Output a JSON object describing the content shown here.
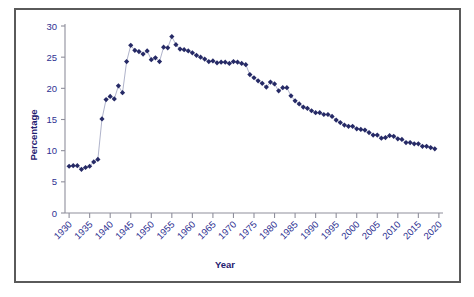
{
  "chart_data": {
    "type": "line",
    "title": "",
    "subtitle": "",
    "xlabel": "Year",
    "ylabel": "Percentage",
    "xlim": [
      1929,
      2021
    ],
    "ylim": [
      0,
      30
    ],
    "xticks": [
      1930,
      1935,
      1940,
      1945,
      1950,
      1955,
      1960,
      1965,
      1970,
      1975,
      1980,
      1985,
      1990,
      1995,
      2000,
      2005,
      2010,
      2015,
      2020
    ],
    "yticks": [
      0,
      5,
      10,
      15,
      20,
      25,
      30
    ],
    "grid": false,
    "legend": "none",
    "marker": "diamond",
    "marker_color": "#262a66",
    "line_color": "#9aa0bd",
    "axis_color": "#8f8f9c",
    "text_color": "#2e3192",
    "frame_color": "#5a5a5a",
    "x": [
      1930,
      1931,
      1932,
      1933,
      1934,
      1935,
      1936,
      1937,
      1938,
      1939,
      1940,
      1941,
      1942,
      1943,
      1944,
      1945,
      1946,
      1947,
      1948,
      1949,
      1950,
      1951,
      1952,
      1953,
      1954,
      1955,
      1956,
      1957,
      1958,
      1959,
      1960,
      1961,
      1962,
      1963,
      1964,
      1965,
      1966,
      1967,
      1968,
      1969,
      1970,
      1971,
      1972,
      1973,
      1974,
      1975,
      1976,
      1977,
      1978,
      1979,
      1980,
      1981,
      1982,
      1983,
      1984,
      1985,
      1986,
      1987,
      1988,
      1989,
      1990,
      1991,
      1992,
      1993,
      1994,
      1995,
      1996,
      1997,
      1998,
      1999,
      2000,
      2001,
      2002,
      2003,
      2004,
      2005,
      2006,
      2007,
      2008,
      2009,
      2010,
      2011,
      2012,
      2013,
      2014,
      2015,
      2016,
      2017,
      2018,
      2019
    ],
    "values": [
      7.5,
      7.6,
      7.6,
      7.0,
      7.3,
      7.5,
      8.2,
      8.6,
      15.1,
      18.2,
      18.7,
      18.3,
      20.4,
      19.3,
      24.3,
      26.9,
      26.1,
      25.9,
      25.5,
      26.0,
      24.6,
      24.9,
      24.3,
      26.6,
      26.5,
      28.3,
      27.0,
      26.3,
      26.2,
      26.0,
      25.7,
      25.3,
      25.0,
      24.7,
      24.3,
      24.4,
      24.1,
      24.2,
      24.2,
      24.0,
      24.3,
      24.2,
      24.0,
      23.8,
      22.2,
      21.7,
      21.2,
      20.8,
      20.2,
      21.0,
      20.7,
      19.6,
      20.1,
      20.1,
      18.8,
      18.0,
      17.5,
      17.0,
      16.8,
      16.4,
      16.1,
      16.1,
      15.8,
      15.8,
      15.5,
      14.9,
      14.5,
      14.1,
      13.9,
      13.9,
      13.5,
      13.4,
      13.3,
      12.9,
      12.5,
      12.5,
      12.0,
      12.1,
      12.4,
      12.3,
      11.9,
      11.8,
      11.3,
      11.3,
      11.1,
      11.1,
      10.7,
      10.7,
      10.5,
      10.3
    ]
  },
  "axis_labels": {
    "y_title": "Percentage",
    "x_title": "Year"
  }
}
